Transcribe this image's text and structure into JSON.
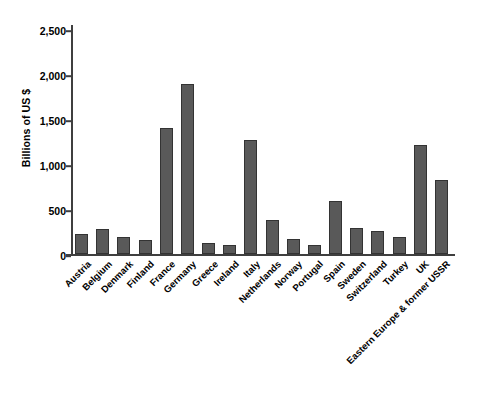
{
  "chart_data": {
    "type": "bar",
    "title": "",
    "xlabel": "",
    "ylabel": "Billions of US $",
    "ylim": [
      0,
      2500
    ],
    "ytick_values": [
      0,
      500,
      1000,
      1500,
      2000,
      2500
    ],
    "ytick_labels": [
      "0",
      "500",
      "1,000",
      "1,500",
      "2,000",
      "2,500"
    ],
    "grid": false,
    "legend": null,
    "xtick_rotation": -45,
    "bar_color": "#595959",
    "bar_edge_color": "#333333",
    "axis_color": "#3f3f3f",
    "background_color": "#ffffff",
    "categories": [
      "Austria",
      "Belgium",
      "Denmark",
      "Finland",
      "France",
      "Germany",
      "Greece",
      "Ireland",
      "Italy",
      "Netherlands",
      "Norway",
      "Portugal",
      "Spain",
      "Sweden",
      "Switzerland",
      "Turkey",
      "UK",
      "Eastern Europe & former USSR"
    ],
    "values": [
      230,
      290,
      195,
      165,
      1420,
      1910,
      125,
      105,
      1275,
      390,
      175,
      110,
      600,
      300,
      260,
      200,
      1225,
      830
    ]
  }
}
